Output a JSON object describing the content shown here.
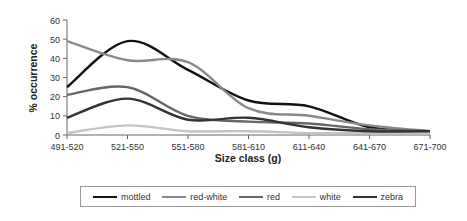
{
  "chart_data": {
    "type": "line",
    "title": "",
    "xlabel": "Size class (g)",
    "ylabel": "% occurrence",
    "ylim": [
      0,
      60
    ],
    "yticks": [
      0,
      10,
      20,
      30,
      40,
      50,
      60
    ],
    "grid": false,
    "legend_position": "bottom",
    "categories": [
      "491-520",
      "521-550",
      "551-580",
      "581-610",
      "611-640",
      "641-670",
      "671-700"
    ],
    "series": [
      {
        "name": "mottled",
        "color": "#111111",
        "values": [
          25,
          49,
          34,
          18,
          15,
          4,
          2
        ]
      },
      {
        "name": "red-white",
        "color": "#8a8a8a",
        "values": [
          49,
          39,
          38,
          14,
          10,
          5,
          2
        ]
      },
      {
        "name": "red",
        "color": "#666666",
        "values": [
          21,
          25,
          10,
          7,
          6,
          3,
          2
        ]
      },
      {
        "name": "white",
        "color": "#c4c4c4",
        "values": [
          1,
          5,
          2,
          2,
          1,
          1,
          1
        ]
      },
      {
        "name": "zebra",
        "color": "#333333",
        "values": [
          9,
          19,
          8,
          9,
          4,
          2,
          2
        ]
      }
    ]
  },
  "legend": {
    "items": [
      {
        "label": "mottled",
        "color": "#111111"
      },
      {
        "label": "red-white",
        "color": "#8a8a8a"
      },
      {
        "label": "red",
        "color": "#666666"
      },
      {
        "label": "white",
        "color": "#c4c4c4"
      },
      {
        "label": "zebra",
        "color": "#333333"
      }
    ]
  }
}
